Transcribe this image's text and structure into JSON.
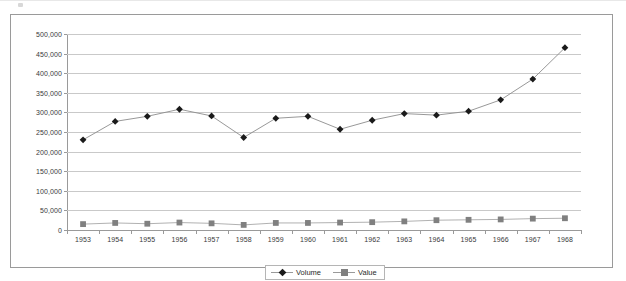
{
  "chart_data": {
    "type": "line",
    "title": "",
    "xlabel": "",
    "ylabel": "",
    "categories": [
      "1953",
      "1954",
      "1955",
      "1956",
      "1957",
      "1958",
      "1959",
      "1960",
      "1961",
      "1962",
      "1963",
      "1964",
      "1965",
      "1966",
      "1967",
      "1968"
    ],
    "series": [
      {
        "name": "Volume",
        "marker": "diamond",
        "color": "#1a1a1a",
        "line_color": "#8c8c8c",
        "values": [
          230000,
          277000,
          290000,
          308000,
          291000,
          236000,
          285000,
          290000,
          257000,
          280000,
          297000,
          293000,
          303000,
          332000,
          385000,
          465000
        ]
      },
      {
        "name": "Value",
        "marker": "square",
        "color": "#808080",
        "line_color": "#a8a8a8",
        "values": [
          15000,
          18000,
          16000,
          19000,
          17000,
          13000,
          18000,
          18000,
          19000,
          20000,
          22000,
          25000,
          26000,
          27000,
          29000,
          30000
        ]
      }
    ],
    "ylim": [
      0,
      500000
    ],
    "ytick_values": [
      0,
      50000,
      100000,
      150000,
      200000,
      250000,
      300000,
      350000,
      400000,
      450000,
      500000
    ],
    "ytick_labels": [
      "0",
      "50,000",
      "100,000",
      "150,000",
      "200,000",
      "250,000",
      "300,000",
      "350,000",
      "400,000",
      "450,000",
      "500,000"
    ],
    "grid": true,
    "legend_position": "bottom"
  },
  "legend": {
    "entries": [
      {
        "label": "Volume",
        "marker": "diamond-marker-icon"
      },
      {
        "label": "Value",
        "marker": "square-marker-icon"
      }
    ]
  },
  "colors": {
    "frame": "#9a9a9a",
    "gridline": "#c9c9c9",
    "axis": "#9a9a9a",
    "volume": "#1a1a1a",
    "value": "#808080",
    "background": "#ffffff",
    "text": "#3a3a3a"
  }
}
